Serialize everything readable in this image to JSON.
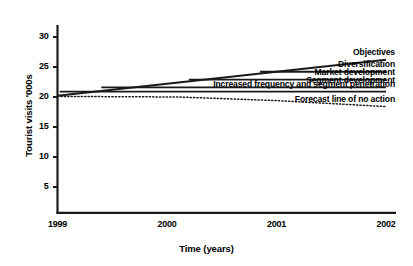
{
  "chart_data": {
    "type": "line",
    "title": "",
    "xlabel": "Time (years)",
    "ylabel": "Tourist visits '000s",
    "x": [
      "1999",
      "2000",
      "2001",
      "2002"
    ],
    "xlim": [
      1999,
      2002
    ],
    "ylim": [
      2.5,
      31.5
    ],
    "yticks": [
      5,
      10,
      15,
      20,
      25,
      30
    ],
    "ytick_labels": [
      "5",
      "10",
      "15",
      "20",
      "25",
      "30"
    ],
    "xtick_labels": [
      "1999",
      "2000",
      "2001",
      "2002"
    ],
    "grid": false,
    "legend": "inline-right-of-line",
    "series": [
      {
        "name": "Objectives",
        "label": "Objectives",
        "style": "solid",
        "points": [
          [
            1999,
            20.2
          ],
          [
            2002,
            26.2
          ]
        ],
        "label_x": 2002,
        "label_y": 26.2
      },
      {
        "name": "Diversification",
        "label": "Diversification",
        "style": "solid",
        "points": [
          [
            2000.85,
            24.2
          ],
          [
            2002,
            24.2
          ]
        ],
        "label_x": 2002,
        "label_y": 24.2
      },
      {
        "name": "Market development",
        "label": "Market development",
        "style": "solid",
        "points": [
          [
            2000.2,
            22.9
          ],
          [
            2002,
            22.9
          ]
        ],
        "label_x": 2002,
        "label_y": 22.9
      },
      {
        "name": "Segment development",
        "label": "Segment development",
        "style": "solid",
        "points": [
          [
            1999.4,
            21.6
          ],
          [
            2002,
            21.6
          ]
        ],
        "label_x": 2002,
        "label_y": 21.6
      },
      {
        "name": "Increased frequency and segment penetration",
        "label": "Increased frequency and segment penetration",
        "style": "solid",
        "points": [
          [
            1999.02,
            20.9
          ],
          [
            2002,
            20.9
          ]
        ],
        "label_x": 2002,
        "label_y": 20.9
      },
      {
        "name": "Forecast line of no action",
        "label": "Forecast line of no action",
        "style": "dotted",
        "points": [
          [
            1999,
            20.1
          ],
          [
            2000.1,
            20.0
          ],
          [
            2001,
            19.4
          ],
          [
            2002,
            18.4
          ]
        ],
        "label_x": 2002,
        "label_y": 18.4
      }
    ],
    "colors": {
      "axis": "#1a1a1a",
      "line": "#1a1a1a",
      "background": "#ffffff",
      "text": "#000000"
    }
  }
}
